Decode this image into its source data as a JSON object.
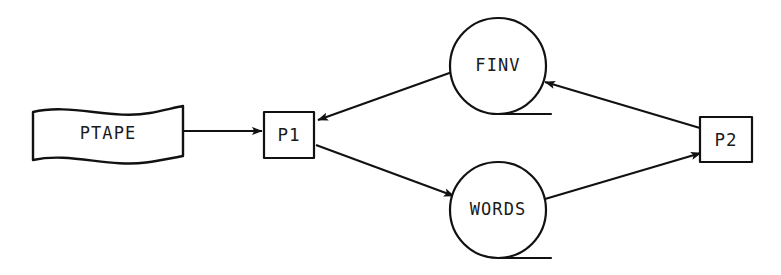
{
  "diagram": {
    "type": "dataflow-diagram",
    "title": "",
    "background_color": "#ffffff",
    "stroke_color": "#111111",
    "text_color": "#1a1a1a",
    "nodes": [
      {
        "id": "ptape",
        "label": "PTAPE",
        "shape": "document-wavy",
        "role": "input-medium",
        "x": 32,
        "y": 108,
        "width": 151,
        "height": 54
      },
      {
        "id": "p1",
        "label": "P1",
        "shape": "rectangle",
        "role": "process",
        "x": 264,
        "y": 112,
        "width": 50,
        "height": 46
      },
      {
        "id": "finv",
        "label": "FINV",
        "shape": "circle-drum",
        "role": "data-store",
        "cx": 498,
        "cy": 66,
        "r": 48
      },
      {
        "id": "words",
        "label": "WORDS",
        "shape": "circle-drum",
        "role": "data-store",
        "cx": 498,
        "cy": 210,
        "r": 48
      },
      {
        "id": "p2",
        "label": "P2",
        "shape": "rectangle",
        "role": "process",
        "x": 700,
        "y": 117,
        "width": 52,
        "height": 45
      }
    ],
    "edges": [
      {
        "id": "ptape-to-p1",
        "from": "ptape",
        "to": "p1",
        "arrow": "to",
        "direction": "right"
      },
      {
        "id": "finv-to-p1",
        "from": "finv",
        "to": "p1",
        "arrow": "to",
        "direction": "down-left"
      },
      {
        "id": "p1-to-words",
        "from": "p1",
        "to": "words",
        "arrow": "to",
        "direction": "down-right"
      },
      {
        "id": "p2-to-finv",
        "from": "p2",
        "to": "finv",
        "arrow": "to",
        "direction": "up-left"
      },
      {
        "id": "words-to-p2",
        "from": "words",
        "to": "p2",
        "arrow": "to",
        "direction": "up-right"
      }
    ]
  }
}
